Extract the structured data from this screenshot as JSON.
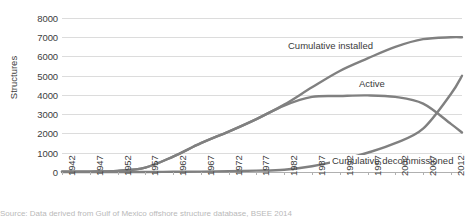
{
  "chart_data": {
    "type": "line",
    "title": "",
    "xlabel": "",
    "ylabel": "Structures",
    "xlim": [
      1942,
      2014
    ],
    "ylim": [
      0,
      8000
    ],
    "grid": true,
    "legend_position": "inline-annotations",
    "y_ticks": [
      "0",
      "1000",
      "2000",
      "3000",
      "4000",
      "5000",
      "6000",
      "7000",
      "8000"
    ],
    "x_ticks": [
      "1942",
      "1947",
      "1952",
      "1957",
      "1962",
      "1967",
      "1972",
      "1977",
      "1982",
      "1987",
      "1992",
      "1997",
      "2002",
      "2007",
      "2012"
    ],
    "x": [
      1942,
      1947,
      1952,
      1957,
      1962,
      1967,
      1972,
      1977,
      1982,
      1987,
      1992,
      1997,
      2002,
      2007,
      2012,
      2014
    ],
    "series": [
      {
        "name": "Cumulative installed",
        "color": "#808080",
        "values": [
          10,
          20,
          60,
          230,
          800,
          1500,
          2100,
          2750,
          3500,
          4400,
          5250,
          5900,
          6500,
          6900,
          7000,
          7000
        ]
      },
      {
        "name": "Active",
        "color": "#808080",
        "values": [
          10,
          20,
          60,
          230,
          800,
          1500,
          2100,
          2750,
          3450,
          3900,
          3950,
          3980,
          3900,
          3550,
          2500,
          2050
        ]
      },
      {
        "name": "Cumulative decommissioned",
        "color": "#808080",
        "values": [
          0,
          0,
          0,
          0,
          10,
          20,
          40,
          70,
          120,
          300,
          600,
          1000,
          1500,
          2250,
          4050,
          5000
        ]
      }
    ],
    "annotations": [
      {
        "text": "Cumulative installed",
        "x": 286,
        "y": 45
      },
      {
        "text": "Active",
        "x": 355,
        "y": 82
      },
      {
        "text": "Cumulative decommissioned",
        "x": 330,
        "y": 160
      }
    ]
  },
  "caption": {
    "text": "Source: Data derived from Gulf of Mexico offshore structure database, BSEE 2014"
  }
}
